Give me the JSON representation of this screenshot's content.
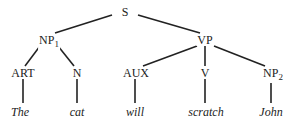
{
  "diagram": {
    "type": "parse-tree",
    "nodes": {
      "s": {
        "label": "S"
      },
      "np1": {
        "label": "NP",
        "sub": "1"
      },
      "vp": {
        "label": "VP"
      },
      "art": {
        "label": "ART"
      },
      "n": {
        "label": "N"
      },
      "aux": {
        "label": "AUX"
      },
      "v": {
        "label": "V"
      },
      "np2": {
        "label": "NP",
        "sub": "2"
      }
    },
    "words": [
      "The",
      "cat",
      "will",
      "scratch",
      "John"
    ],
    "edges": [
      [
        "S",
        "NP1"
      ],
      [
        "S",
        "VP"
      ],
      [
        "NP1",
        "ART"
      ],
      [
        "NP1",
        "N"
      ],
      [
        "VP",
        "AUX"
      ],
      [
        "VP",
        "V"
      ],
      [
        "VP",
        "NP2"
      ],
      [
        "ART",
        "The"
      ],
      [
        "N",
        "cat"
      ],
      [
        "AUX",
        "will"
      ],
      [
        "V",
        "scratch"
      ],
      [
        "NP2",
        "John"
      ]
    ]
  }
}
